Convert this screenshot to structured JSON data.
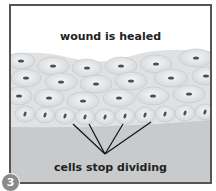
{
  "diagram": {
    "title": "wound is healed",
    "caption": "cells stop dividing",
    "step_number": "3",
    "colors": {
      "frame": "#555555",
      "cells": "#e9ebec",
      "nuclei": "#4a4f55",
      "base_tissue": "#c8cacc",
      "step_badge": "#8a8a8a"
    }
  }
}
